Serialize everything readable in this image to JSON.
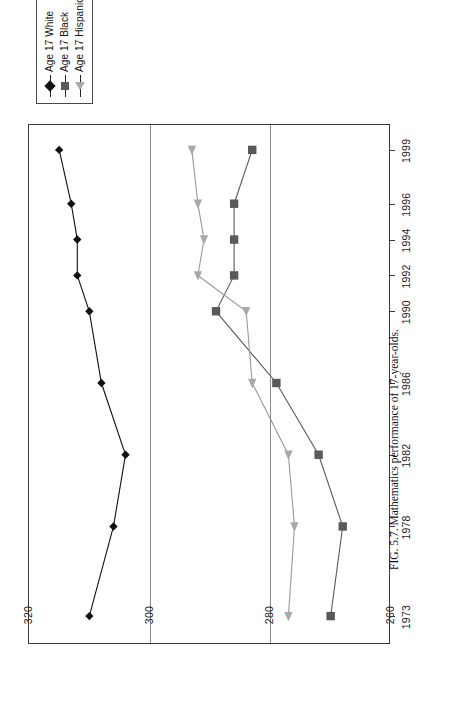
{
  "figure": {
    "caption": "FIG. 5.7.  Mathematics performance of 17-year-olds."
  },
  "legend": {
    "position": "top-right",
    "items": [
      {
        "label": "Age 17 White",
        "marker": "diamond-marker",
        "color": "#111111"
      },
      {
        "label": "Age 17 Black",
        "marker": "square-marker",
        "color": "#595959"
      },
      {
        "label": "Age 17 Hispanic",
        "marker": "triangle-marker",
        "color": "#a8a8a8"
      }
    ]
  },
  "axes": {
    "y_ticks": [
      "320",
      "300",
      "280",
      "260"
    ],
    "x_ticks": [
      "1973",
      "1978",
      "1982",
      "1986",
      "1990",
      "1992",
      "1994",
      "1996",
      "1999"
    ]
  },
  "chart_data": {
    "type": "line",
    "title": "",
    "xlabel": "",
    "ylabel": "",
    "grid": true,
    "legend_position": "top-right",
    "x": [
      1973,
      1978,
      1982,
      1986,
      1990,
      1992,
      1994,
      1996,
      1999
    ],
    "categories": [
      "1973",
      "1978",
      "1982",
      "1986",
      "1990",
      "1992",
      "1994",
      "1996",
      "1999"
    ],
    "xlim": [
      1971.5,
      2000.5
    ],
    "ylim": [
      260,
      320
    ],
    "yticks": [
      260,
      280,
      300,
      320
    ],
    "series": [
      {
        "name": "Age 17 White",
        "marker": "diamond",
        "color": "#111111",
        "values": [
          310,
          306,
          304,
          308,
          310,
          312,
          312,
          313,
          315
        ]
      },
      {
        "name": "Age 17 Black",
        "marker": "square",
        "color": "#595959",
        "values": [
          270,
          268,
          272,
          279,
          289,
          286,
          286,
          286,
          283
        ]
      },
      {
        "name": "Age 17 Hispanic",
        "marker": "triangle",
        "color": "#a8a8a8",
        "values": [
          277,
          276,
          277,
          283,
          284,
          292,
          291,
          292,
          293
        ]
      }
    ]
  }
}
